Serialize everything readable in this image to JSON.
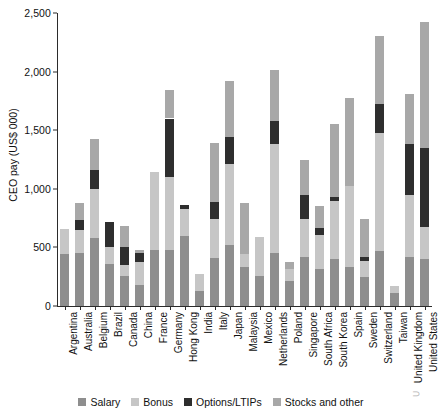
{
  "chart_data": {
    "type": "bar",
    "stacked": true,
    "title": "",
    "xlabel": "",
    "ylabel": "CEO pay (US$ 000)",
    "ylim": [
      0,
      2500
    ],
    "yticks": [
      0,
      500,
      1000,
      1500,
      2000,
      2500
    ],
    "ytick_labels": [
      "0",
      "500",
      "1,000",
      "1,500",
      "2,000",
      "2,500"
    ],
    "grid": false,
    "legend_position": "bottom",
    "categories": [
      "Argentina",
      "Australia",
      "Belgium",
      "Brazil",
      "Canada",
      "China",
      "France",
      "Germany",
      "Hong Kong",
      "India",
      "Italy",
      "Japan",
      "Malaysia",
      "Mexico",
      "Netherlands",
      "Poland",
      "Singapore",
      "South Africa",
      "South Korea",
      "Spain",
      "Sweden",
      "Switzerland",
      "Taiwan",
      "United Kingdom",
      "United States"
    ],
    "series": [
      {
        "name": "Salary",
        "color": "#8e8e8e",
        "values": [
          440,
          450,
          580,
          360,
          260,
          180,
          480,
          480,
          600,
          130,
          410,
          520,
          330,
          260,
          450,
          210,
          420,
          320,
          400,
          330,
          250,
          470,
          110,
          420,
          400
        ]
      },
      {
        "name": "Bonus",
        "color": "#c6c6c6",
        "values": [
          215,
          195,
          420,
          140,
          90,
          195,
          665,
          620,
          225,
          140,
          330,
          690,
          110,
          330,
          930,
          105,
          325,
          290,
          500,
          690,
          130,
          1010,
          65,
          530,
          270
        ]
      },
      {
        "name": "Options/LTIPs",
        "color": "#2e2e2e",
        "values": [
          0,
          85,
          160,
          215,
          150,
          75,
          0,
          500,
          40,
          0,
          145,
          230,
          0,
          0,
          200,
          0,
          200,
          55,
          30,
          0,
          40,
          240,
          0,
          430,
          680
        ]
      },
      {
        "name": "Stocks and other",
        "color": "#a8a8a8",
        "values": [
          0,
          145,
          265,
          0,
          185,
          30,
          0,
          240,
          0,
          0,
          510,
          480,
          440,
          0,
          430,
          60,
          305,
          185,
          620,
          755,
          325,
          585,
          0,
          425,
          1070
        ]
      }
    ],
    "totals": [
      655,
      875,
      1425,
      715,
      685,
      480,
      1145,
      1840,
      865,
      270,
      1395,
      1920,
      880,
      590,
      2010,
      375,
      1250,
      850,
      1550,
      1775,
      745,
      2305,
      175,
      1805,
      2420
    ]
  },
  "legend": {
    "items": [
      {
        "label": "Salary",
        "color": "#8e8e8e"
      },
      {
        "label": "Bonus",
        "color": "#c6c6c6"
      },
      {
        "label": "Options/LTIPs",
        "color": "#2e2e2e"
      },
      {
        "label": "Stocks and other",
        "color": "#a8a8a8"
      }
    ]
  },
  "artifacts": {
    "top_sliver": "",
    "legend_corner_glyph": "⊃"
  }
}
